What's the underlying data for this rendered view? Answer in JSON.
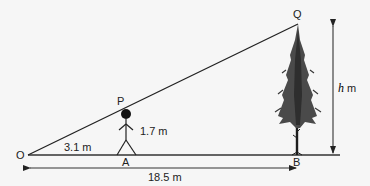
{
  "diagram": {
    "type": "similar-triangles-height-problem",
    "points": {
      "O": {
        "label": "O"
      },
      "P": {
        "label": "P"
      },
      "Q": {
        "label": "Q"
      },
      "A": {
        "label": "A"
      },
      "B": {
        "label": "B"
      }
    },
    "measurements": {
      "OA": "3.1 m",
      "AP": "1.7 m",
      "OB": "18.5 m",
      "BQ_prefix": "h",
      "BQ_suffix": " m"
    },
    "objects": {
      "person": "stick-figure",
      "tree": "conifer-tree"
    },
    "colors": {
      "background": "#f6f6f6",
      "line": "#222222",
      "tree": "#4a4a4a",
      "tree_dark": "#2a2a2a"
    }
  }
}
